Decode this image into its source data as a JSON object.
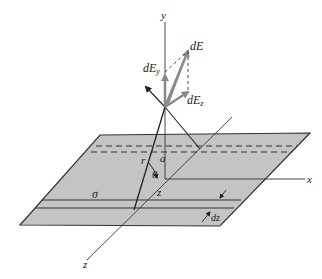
{
  "diagram": {
    "colors": {
      "plane_fill": "#c4c4c4",
      "plane_edge": "#333333",
      "axis": "#333333",
      "vector": "#8a8a8a",
      "dashed": "#333333"
    },
    "labels": {
      "y_axis": "y",
      "x_axis": "x",
      "z_axis": "z",
      "dE": "dE",
      "dEy": "dE",
      "dEy_sub": "y",
      "dEz": "dE",
      "dEz_sub": "z",
      "r": "r",
      "a": "a",
      "theta": "θ",
      "z_dist": "z",
      "sigma": "σ",
      "dz": "dz"
    }
  }
}
